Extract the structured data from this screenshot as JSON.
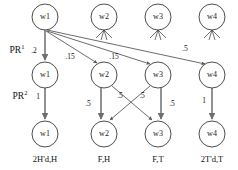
{
  "figure": {
    "kind": "weighted-directed-graph",
    "rows": 3,
    "columns": 4
  },
  "row_labels": [
    {
      "base": "PR",
      "exponent": "1",
      "full": "PR1"
    },
    {
      "base": "PR",
      "exponent": "2",
      "full": "PR2"
    }
  ],
  "nodes": {
    "row0": [
      {
        "id": "r0c0",
        "label": "w1",
        "cx": 45,
        "cy": 17,
        "r": 13
      },
      {
        "id": "r0c1",
        "label": "w2",
        "cx": 104,
        "cy": 17,
        "r": 13
      },
      {
        "id": "r0c2",
        "label": "w3",
        "cx": 158,
        "cy": 17,
        "r": 13
      },
      {
        "id": "r0c3",
        "label": "w4",
        "cx": 212,
        "cy": 17,
        "r": 13
      }
    ],
    "row1": [
      {
        "id": "r1c0",
        "label": "w1",
        "cx": 45,
        "cy": 75,
        "r": 13
      },
      {
        "id": "r1c1",
        "label": "w2",
        "cx": 104,
        "cy": 75,
        "r": 13
      },
      {
        "id": "r1c2",
        "label": "w3",
        "cx": 158,
        "cy": 75,
        "r": 13
      },
      {
        "id": "r1c3",
        "label": "w4",
        "cx": 212,
        "cy": 75,
        "r": 13
      }
    ],
    "row2": [
      {
        "id": "r2c0",
        "label": "w1",
        "cx": 45,
        "cy": 134,
        "r": 13
      },
      {
        "id": "r2c1",
        "label": "w2",
        "cx": 104,
        "cy": 134,
        "r": 13
      },
      {
        "id": "r2c2",
        "label": "w3",
        "cx": 158,
        "cy": 134,
        "r": 13
      },
      {
        "id": "r2c3",
        "label": "w4",
        "cx": 212,
        "cy": 134,
        "r": 13
      }
    ]
  },
  "edges": [
    {
      "id": "e1",
      "from": "r0c0",
      "to": "r1c0",
      "weight": ".2",
      "label_x": 34,
      "label_y": 51
    },
    {
      "id": "e2",
      "from": "r0c0",
      "to": "r1c1",
      "weight": ".15",
      "label_x": 70,
      "label_y": 57
    },
    {
      "id": "e3",
      "from": "r0c0",
      "to": "r1c2",
      "weight": ".15",
      "label_x": 114,
      "label_y": 57
    },
    {
      "id": "e4",
      "from": "r0c0",
      "to": "r1c3",
      "weight": ".5",
      "label_x": 185,
      "label_y": 49
    },
    {
      "id": "e5",
      "from": "r1c0",
      "to": "r2c0",
      "weight": "1",
      "label_x": 38,
      "label_y": 97
    },
    {
      "id": "e6",
      "from": "r1c1",
      "to": "r2c1",
      "weight": ".5",
      "label_x": 88,
      "label_y": 104
    },
    {
      "id": "e7",
      "from": "r1c1",
      "to": "r2c2",
      "weight": ".5",
      "label_x": 120,
      "label_y": 96
    },
    {
      "id": "e8",
      "from": "r1c2",
      "to": "r2c1",
      "weight": ".5",
      "label_x": 142,
      "label_y": 96
    },
    {
      "id": "e9",
      "from": "r1c2",
      "to": "r2c2",
      "weight": ".5",
      "label_x": 172,
      "label_y": 104
    },
    {
      "id": "e10",
      "from": "r1c3",
      "to": "r2c3",
      "weight": "1",
      "label_x": 204,
      "label_y": 101
    }
  ],
  "captions": [
    {
      "id": "cap0",
      "text": "2H'd,H",
      "x": 45,
      "y": 160
    },
    {
      "id": "cap1",
      "text": "F,H",
      "x": 104,
      "y": 160
    },
    {
      "id": "cap2",
      "text": "F,T",
      "x": 158,
      "y": 160
    },
    {
      "id": "cap3",
      "text": "2T'd,T",
      "x": 212,
      "y": 160
    }
  ],
  "colors": {
    "background": "#ffffff",
    "node_stroke": "#3a3a3a",
    "edge_stroke": "#5a5a5a",
    "text": "#111111"
  }
}
